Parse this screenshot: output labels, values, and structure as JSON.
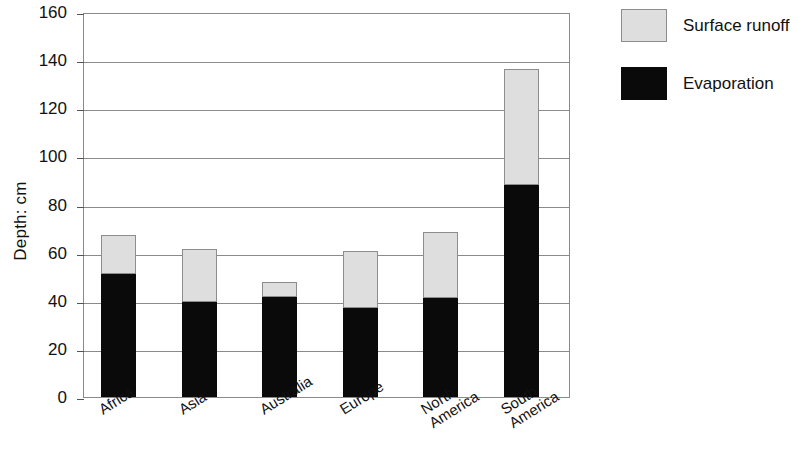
{
  "chart_data": {
    "type": "bar",
    "stacked": true,
    "title": "",
    "xlabel": "",
    "ylabel": "Depth: cm",
    "ylim": [
      0,
      160
    ],
    "ytick_step": 20,
    "yticks": [
      0,
      20,
      40,
      60,
      80,
      100,
      120,
      140,
      160
    ],
    "ytick_labels": [
      "0",
      "20",
      "40",
      "60",
      "80",
      "100",
      "120",
      "140",
      "160"
    ],
    "grid": "horizontal",
    "categories": [
      "Africa",
      "Asia",
      "Australia",
      "Europe",
      "North America",
      "South America"
    ],
    "category_label_lines": [
      [
        "Africa"
      ],
      [
        "Asia"
      ],
      [
        "Australia"
      ],
      [
        "Europe"
      ],
      [
        "North",
        "America"
      ],
      [
        "South",
        "America"
      ]
    ],
    "series": [
      {
        "name": "Evaporation",
        "color": "#0a0a0a",
        "values": [
          51,
          39.5,
          41.5,
          37,
          41,
          88
        ]
      },
      {
        "name": "Surface runoff",
        "color": "#dedede",
        "values": [
          16.5,
          22,
          6.5,
          23.5,
          27.5,
          48.5
        ]
      }
    ],
    "totals": [
      67.5,
      61.5,
      48,
      60.5,
      68.5,
      136.5
    ],
    "legend": {
      "position": "right",
      "entries": [
        {
          "label": "Surface runoff",
          "swatch": "light-gray"
        },
        {
          "label": "Evaporation",
          "swatch": "black"
        }
      ]
    }
  },
  "legend": {
    "entries": [
      {
        "label": "Surface runoff"
      },
      {
        "label": "Evaporation"
      }
    ]
  },
  "axis": {
    "y_title": "Depth: cm"
  },
  "colors": {
    "runoff_fill": "#dedede",
    "runoff_stroke": "#8d8d8d",
    "evaporation_fill": "#0a0a0a",
    "frame": "#8a8a8a",
    "background": "#ffffff"
  }
}
